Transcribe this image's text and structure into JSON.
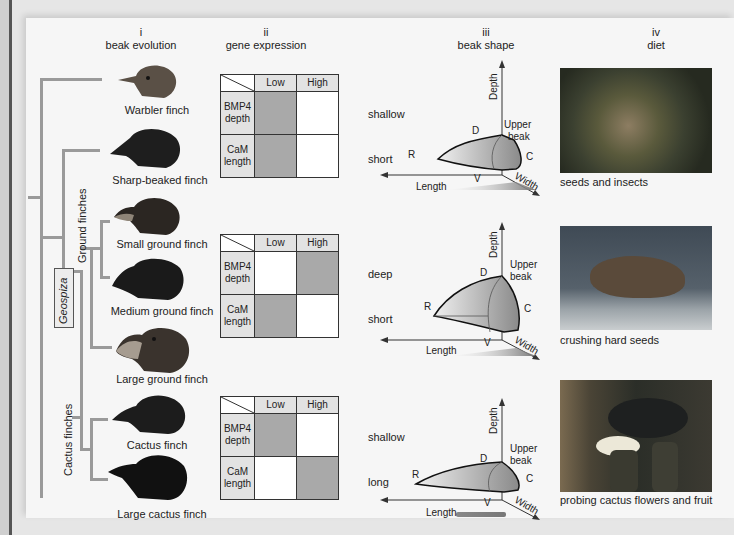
{
  "columns": [
    {
      "numeral": "i",
      "title": "beak evolution"
    },
    {
      "numeral": "ii",
      "title": "gene expression"
    },
    {
      "numeral": "iii",
      "title": "beak shape"
    },
    {
      "numeral": "iv",
      "title": "diet"
    }
  ],
  "tree": {
    "genus_label": "Geospiza",
    "groups": [
      {
        "label": "Ground finches"
      },
      {
        "label": "Cactus finches"
      }
    ]
  },
  "finches": [
    {
      "name": "Warbler finch"
    },
    {
      "name": "Sharp-beaked finch"
    },
    {
      "name": "Small ground finch"
    },
    {
      "name": "Medium ground finch"
    },
    {
      "name": "Large ground finch"
    },
    {
      "name": "Cactus finch"
    },
    {
      "name": "Large cactus finch"
    }
  ],
  "gene_tables": [
    {
      "col_headers": [
        "Low",
        "High"
      ],
      "rows": [
        {
          "gene": "BMP4",
          "trait": "depth",
          "level": "Low",
          "outcome": "shallow"
        },
        {
          "gene": "CaM",
          "trait": "length",
          "level": "Low",
          "outcome": "short"
        }
      ]
    },
    {
      "col_headers": [
        "Low",
        "High"
      ],
      "rows": [
        {
          "gene": "BMP4",
          "trait": "depth",
          "level": "High",
          "outcome": "deep"
        },
        {
          "gene": "CaM",
          "trait": "length",
          "level": "Low",
          "outcome": "short"
        }
      ]
    },
    {
      "col_headers": [
        "Low",
        "High"
      ],
      "rows": [
        {
          "gene": "BMP4",
          "trait": "depth",
          "level": "Low",
          "outcome": "shallow"
        },
        {
          "gene": "CaM",
          "trait": "length",
          "level": "High",
          "outcome": "long"
        }
      ]
    }
  ],
  "beak_shape": {
    "axis_labels": {
      "depth": "Depth",
      "length": "Length",
      "width": "Width"
    },
    "point_labels": {
      "dorsal": "D",
      "rostral": "R",
      "caudal": "C",
      "ventral": "V"
    },
    "upper_beak_label": [
      "Upper",
      "beak"
    ]
  },
  "diets": [
    {
      "caption": "seeds and insects"
    },
    {
      "caption": "crushing hard seeds"
    },
    {
      "caption": "probing cactus flowers and fruit"
    }
  ],
  "colors": {
    "tree_line": "#9a9a9a",
    "expression_on": "#a9a9a9",
    "label_bg": "#e2e2e2",
    "background": "#f6f6f6"
  }
}
